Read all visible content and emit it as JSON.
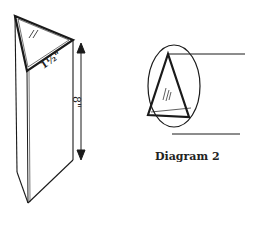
{
  "diagram1": {
    "width_label": "1½\"",
    "height_label": "8\"",
    "glass_hatch": "glass-reflection",
    "stroke_color": "#1a1a1a"
  },
  "diagram2": {
    "caption": "Diagram 2",
    "glass_hatch": "glass-reflection",
    "stroke_color": "#1a1a1a"
  }
}
